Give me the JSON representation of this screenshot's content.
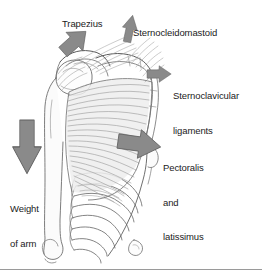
{
  "figure": {
    "width": 262,
    "height": 276,
    "background_color": "#ffffff",
    "rule_color": "#9a9a9a"
  },
  "colors": {
    "arrow_fill": "#8a8a8a",
    "arrow_stroke": "#5f5f5f",
    "line_art": "#6e6e6e",
    "line_art_dark": "#4a4a4a",
    "text": "#1b1b1b",
    "muscle_shade": "#e9e9e9",
    "bone_fill": "#fbfbfb"
  },
  "labels": {
    "trapezius": "Trapezius",
    "sternocleidomastoid": "Sternocleidomastoid",
    "sternoclavicular_line1": "Sternoclavicular",
    "sternoclavicular_line2": "ligaments",
    "pectoralis_line1": "Pectoralis",
    "pectoralis_line2": "and",
    "pectoralis_line3": "latissimus",
    "weight_line1": "Weight",
    "weight_line2": "of arm"
  },
  "arrows": [
    {
      "name": "trapezius-arrow",
      "label": "Trapezius",
      "direction": "up-right",
      "angle_deg": -42,
      "size": "medium"
    },
    {
      "name": "sternocleidomastoid-arrow",
      "label": "Sternocleidomastoid",
      "direction": "up",
      "angle_deg": -12,
      "size": "narrow"
    },
    {
      "name": "sternoclavicular-arrow",
      "label": "Sternoclavicular ligaments",
      "direction": "right",
      "angle_deg": 0,
      "size": "small"
    },
    {
      "name": "pectoralis-arrow",
      "label": "Pectoralis and latissimus",
      "direction": "right",
      "angle_deg": 8,
      "size": "large"
    },
    {
      "name": "weight-of-arm-arrow",
      "label": "Weight of arm",
      "direction": "down",
      "angle_deg": 90,
      "size": "large"
    }
  ],
  "anatomy": [
    {
      "name": "humerus",
      "description": "upper arm bone running down left side"
    },
    {
      "name": "scapula",
      "description": "shoulder blade at upper left"
    },
    {
      "name": "clavicle",
      "description": "collarbone at top center"
    },
    {
      "name": "ribcage",
      "description": "curved ribs at lower center"
    },
    {
      "name": "muscle-fibers",
      "description": "fan of radiating muscle fiber lines"
    }
  ]
}
